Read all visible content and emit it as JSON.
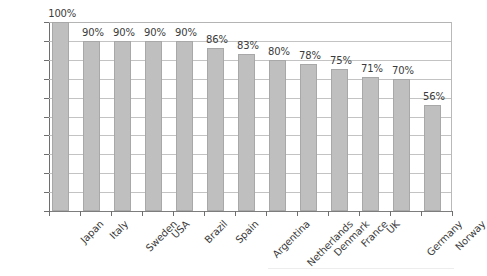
{
  "chart_data": {
    "type": "bar",
    "title": "",
    "subtitle": "",
    "xlabel": "",
    "ylabel": "",
    "categories": [
      "Japan",
      "Italy",
      "Sweden",
      "USA",
      "Brazil",
      "Spain",
      "Argentina",
      "Netherlands",
      "Denmark",
      "France",
      "UK",
      "Germany",
      "Norway"
    ],
    "values": [
      100,
      90,
      90,
      90,
      90,
      86,
      83,
      80,
      78,
      75,
      71,
      70,
      56
    ],
    "value_labels": [
      "100%",
      "90%",
      "90%",
      "90%",
      "90%",
      "86%",
      "83%",
      "80%",
      "78%",
      "75%",
      "71%",
      "70%",
      "56%"
    ],
    "ylim": [
      0,
      100
    ],
    "ytick_values": [
      0,
      10,
      20,
      30,
      40,
      50,
      60,
      70,
      80,
      90,
      100
    ],
    "ytick_labels": [
      "0%",
      "10%",
      "20%",
      "30%",
      "40%",
      "50%",
      "60%",
      "70%",
      "80%",
      "90%",
      "100%"
    ],
    "grid": "horizontal",
    "legend": "none",
    "series_name": "",
    "bar_color": "#bfbfbf",
    "bar_border_color": "#a8a8a8",
    "gridline_color": "#c3c3c3",
    "axis_color": "#6e6e6e",
    "text_color": "#3b3b3b",
    "xtick_label_rotation": -45
  }
}
